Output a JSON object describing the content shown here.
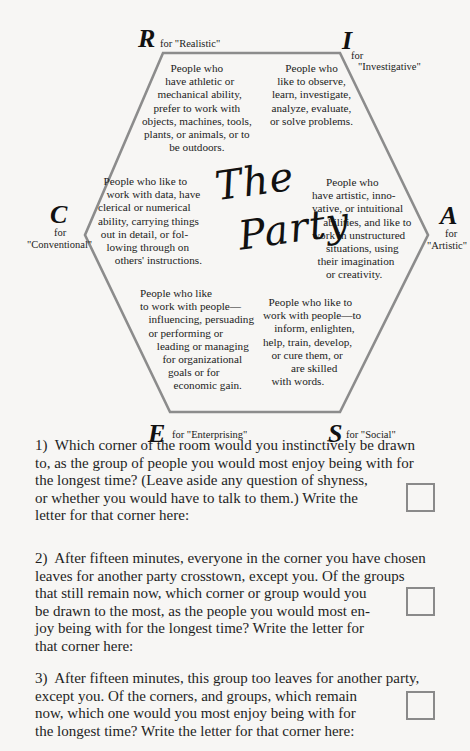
{
  "diagram": {
    "title_line1": "The",
    "title_line2": "Party",
    "corners": {
      "R": {
        "letter": "R",
        "label": "for \"Realistic\"",
        "description": "People who\n  have athletic or\n  mechanical ability,\nprefer to work with\nobjects, machines, tools,\nplants, or animals, or to\nbe outdoors."
      },
      "I": {
        "letter": "I",
        "label_for": "for",
        "label_word": "\"Investigative\"",
        "description": "People who\nlike to observe,\nlearn, investigate,\nanalyze, evaluate,\nor solve problems."
      },
      "A": {
        "letter": "A",
        "label_for": "for",
        "label_word": "\"Artistic\"",
        "description": "     People who\nhave artistic, inno-\nvative, or intuitional\n    abilities, and like to\nwork in unstructured\n     situations, using\n  their imagination\n     or creativity."
      },
      "S": {
        "letter": "S",
        "label": "for \"Social\"",
        "description": "  People who like to\nwork with people—to\n    inform, enlighten,\nhelp, train, develop,\n   or cure them, or\n          are skilled\n   with words."
      },
      "E": {
        "letter": "E",
        "label": "for \"Enterprising\"",
        "description": "People who like\nto work with people—\n   influencing, persuading\n   or performing or\n      leading or managing\n        for organizational\n          goals or for\n            economic gain."
      },
      "C": {
        "letter": "C",
        "label_for": "for",
        "label_word": "\"Conventional\"",
        "description": "  People who like to\n   work with data, have\nclerical or numerical\nability, carrying things\n out in detail, or fol-\n   lowing through on\n      others' instructions."
      }
    }
  },
  "questions": [
    {
      "number": "1)",
      "text": "1)  Which corner of the room would you instinctively be drawn\nto, as the group of people you would most enjoy being with for\nthe longest time? (Leave aside any question of shyness,\nor whether you would have to talk to them.) Write the\nletter for that corner here:",
      "answer": ""
    },
    {
      "number": "2)",
      "text": "2)  After fifteen minutes, everyone in the corner you have chosen\nleaves for another party crosstown, except you. Of the groups\nthat still remain now, which corner or group would you\nbe drawn to the most, as the people you would most en-\njoy being with for the longest time? Write the letter for\nthat corner here:",
      "answer": ""
    },
    {
      "number": "3)",
      "text": "3)  After fifteen minutes, this group too leaves for another party,\nexcept you. Of the corners, and groups, which remain\nnow, which one would you most enjoy being with for\nthe longest time? Write the letter for that corner here:",
      "answer": ""
    }
  ],
  "colors": {
    "hexagon_stroke": "#8c8c8c",
    "background": "#f7f6f4",
    "text": "#1e1e1e"
  }
}
